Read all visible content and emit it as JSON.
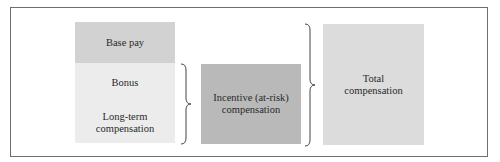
{
  "diagram": {
    "components": [
      {
        "label": "Base pay",
        "color": "#d2d2d2"
      },
      {
        "label": "Bonus",
        "color": "#ececec"
      },
      {
        "label": "Long-term\ncompensation",
        "color": "#ececec"
      }
    ],
    "incentive": {
      "label": "Incentive (at-risk)\ncompensation",
      "color": "#b9b9b9"
    },
    "total": {
      "label": "Total\ncompensation",
      "color": "#dcdcdc"
    }
  }
}
